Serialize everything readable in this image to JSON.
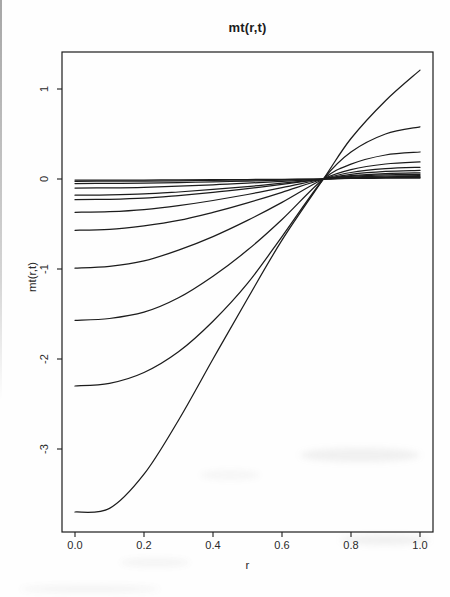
{
  "title": "mt(r,t)",
  "x_axis": {
    "label": "r",
    "tick_labels": [
      "0.0",
      "0.2",
      "0.4",
      "0.6",
      "0.8",
      "1.0"
    ],
    "tick_values": [
      0.0,
      0.2,
      0.4,
      0.6,
      0.8,
      1.0
    ]
  },
  "y_axis": {
    "label": "mt(r,t)",
    "tick_labels": [
      "1",
      "0",
      "-1",
      "-2",
      "-3"
    ],
    "tick_values": [
      1,
      0,
      -1,
      -2,
      -3
    ]
  },
  "colors": {
    "line": "#1c1c1c",
    "axis": "#1c1c1c",
    "background": "#fefefe"
  },
  "chart_data": {
    "type": "line",
    "title": "mt(r,t)",
    "xlabel": "r",
    "ylabel": "mt(r,t)",
    "xlim": [
      -0.04,
      1.04
    ],
    "ylim": [
      -3.92,
      1.41
    ],
    "grid": false,
    "legend": "none",
    "pivot_point": {
      "r": 0.72,
      "value": 0
    },
    "x": [
      0.0,
      0.1,
      0.2,
      0.3,
      0.4,
      0.5,
      0.6,
      0.72,
      0.8,
      0.9,
      1.0
    ],
    "series": [
      {
        "name": "c1",
        "values": [
          -3.7,
          -3.66,
          -3.28,
          -2.68,
          -2.0,
          -1.33,
          -0.68,
          0,
          0.45,
          0.87,
          1.21
        ]
      },
      {
        "name": "c2",
        "values": [
          -2.3,
          -2.27,
          -2.15,
          -1.92,
          -1.58,
          -1.16,
          -0.64,
          0,
          0.3,
          0.5,
          0.58
        ]
      },
      {
        "name": "c3",
        "values": [
          -1.57,
          -1.55,
          -1.48,
          -1.32,
          -1.08,
          -0.79,
          -0.45,
          0,
          0.165,
          0.267,
          0.3
        ]
      },
      {
        "name": "c4",
        "values": [
          -0.99,
          -0.97,
          -0.91,
          -0.79,
          -0.64,
          -0.46,
          -0.26,
          0,
          0.105,
          0.167,
          0.19
        ]
      },
      {
        "name": "c5",
        "values": [
          -0.57,
          -0.56,
          -0.52,
          -0.46,
          -0.37,
          -0.265,
          -0.148,
          0,
          0.072,
          0.114,
          0.13
        ]
      },
      {
        "name": "c6",
        "values": [
          -0.37,
          -0.363,
          -0.34,
          -0.296,
          -0.239,
          -0.172,
          -0.096,
          0,
          0.052,
          0.084,
          0.095
        ]
      },
      {
        "name": "c7",
        "values": [
          -0.23,
          -0.225,
          -0.212,
          -0.184,
          -0.148,
          -0.107,
          -0.06,
          0,
          0.037,
          0.06,
          0.068
        ]
      },
      {
        "name": "c8",
        "values": [
          -0.18,
          -0.176,
          -0.166,
          -0.144,
          -0.116,
          -0.084,
          -0.047,
          0,
          0.029,
          0.046,
          0.052
        ]
      },
      {
        "name": "c9",
        "values": [
          -0.1,
          -0.098,
          -0.092,
          -0.08,
          -0.065,
          -0.047,
          -0.026,
          0,
          0.021,
          0.033,
          0.038
        ]
      },
      {
        "name": "c10",
        "values": [
          -0.05,
          -0.049,
          -0.046,
          -0.04,
          -0.032,
          -0.023,
          -0.013,
          0,
          0.015,
          0.024,
          0.027
        ]
      },
      {
        "name": "c11",
        "values": [
          -0.025,
          -0.0245,
          -0.023,
          -0.02,
          -0.016,
          -0.012,
          -0.007,
          0,
          0.01,
          0.016,
          0.018
        ]
      },
      {
        "name": "c12",
        "values": [
          -0.012,
          -0.012,
          -0.011,
          -0.01,
          -0.008,
          -0.006,
          -0.003,
          0,
          0.006,
          0.009,
          0.01
        ]
      }
    ]
  }
}
